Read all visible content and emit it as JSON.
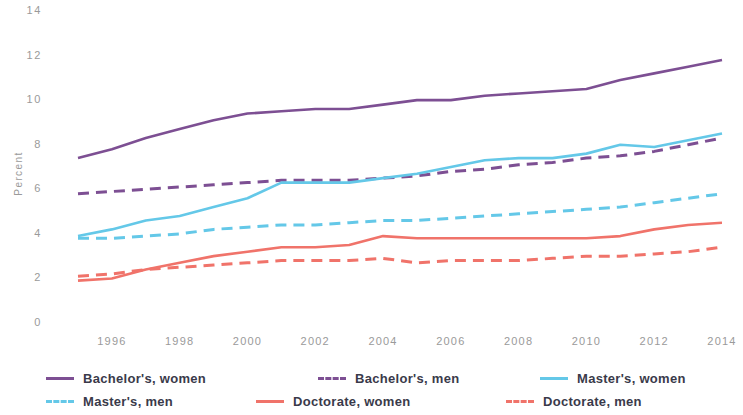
{
  "chart_data": {
    "type": "line",
    "title": "",
    "subtitle": "",
    "xlabel": "",
    "ylabel": "Percent",
    "grid": false,
    "legend_position": "bottom",
    "xlim": [
      1995,
      2014
    ],
    "ylim": [
      0,
      14
    ],
    "ytick_labels": [
      "14",
      "12",
      "10",
      "8",
      "6",
      "4",
      "2",
      "0"
    ],
    "ytick_values": [
      14,
      12,
      10,
      8,
      6,
      4,
      2,
      0
    ],
    "xtick_labels": [
      "1996",
      "1998",
      "2000",
      "2002",
      "2004",
      "2006",
      "2008",
      "2010",
      "2012",
      "2014"
    ],
    "xtick_values": [
      1996,
      1998,
      2000,
      2002,
      2004,
      2006,
      2008,
      2010,
      2012,
      2014
    ],
    "x": [
      1995,
      1996,
      1997,
      1998,
      1999,
      2000,
      2001,
      2002,
      2003,
      2004,
      2005,
      2006,
      2007,
      2008,
      2009,
      2010,
      2011,
      2012,
      2013,
      2014
    ],
    "series": [
      {
        "name": "Bachelor's, women",
        "color": "#7d4f93",
        "style": "solid",
        "values": [
          7.4,
          7.8,
          8.3,
          8.7,
          9.1,
          9.4,
          9.5,
          9.6,
          9.6,
          9.8,
          10.0,
          10.0,
          10.2,
          10.3,
          10.4,
          10.5,
          10.9,
          11.2,
          11.5,
          11.8
        ]
      },
      {
        "name": "Bachelor's, men",
        "color": "#7d4f93",
        "style": "dashed",
        "values": [
          5.8,
          5.9,
          6.0,
          6.1,
          6.2,
          6.3,
          6.4,
          6.4,
          6.4,
          6.5,
          6.6,
          6.8,
          6.9,
          7.1,
          7.2,
          7.4,
          7.5,
          7.7,
          8.0,
          8.3
        ]
      },
      {
        "name": "Master's, women",
        "color": "#64c8e8",
        "style": "solid",
        "values": [
          3.9,
          4.2,
          4.6,
          4.8,
          5.2,
          5.6,
          6.3,
          6.3,
          6.3,
          6.5,
          6.7,
          7.0,
          7.3,
          7.4,
          7.4,
          7.6,
          8.0,
          7.9,
          8.2,
          8.5
        ]
      },
      {
        "name": "Master's, men",
        "color": "#64c8e8",
        "style": "dashed",
        "values": [
          3.8,
          3.8,
          3.9,
          4.0,
          4.2,
          4.3,
          4.4,
          4.4,
          4.5,
          4.6,
          4.6,
          4.7,
          4.8,
          4.9,
          5.0,
          5.1,
          5.2,
          5.4,
          5.6,
          5.8
        ]
      },
      {
        "name": "Doctorate, women",
        "color": "#f0736a",
        "style": "solid",
        "values": [
          1.9,
          2.0,
          2.4,
          2.7,
          3.0,
          3.2,
          3.4,
          3.4,
          3.5,
          3.9,
          3.8,
          3.8,
          3.8,
          3.8,
          3.8,
          3.8,
          3.9,
          4.2,
          4.4,
          4.5
        ]
      },
      {
        "name": "Doctorate, men",
        "color": "#f0736a",
        "style": "dashed",
        "values": [
          2.1,
          2.2,
          2.4,
          2.5,
          2.6,
          2.7,
          2.8,
          2.8,
          2.8,
          2.9,
          2.7,
          2.8,
          2.8,
          2.8,
          2.9,
          3.0,
          3.0,
          3.1,
          3.2,
          3.4
        ]
      }
    ]
  },
  "legend": {
    "items": [
      {
        "label": "Bachelor's, women",
        "color": "#7d4f93",
        "style": "solid"
      },
      {
        "label": "Bachelor's, men",
        "color": "#7d4f93",
        "style": "dashed"
      },
      {
        "label": "Master's, women",
        "color": "#64c8e8",
        "style": "solid"
      },
      {
        "label": "Master's, men",
        "color": "#64c8e8",
        "style": "dashed"
      },
      {
        "label": "Doctorate, women",
        "color": "#f0736a",
        "style": "solid"
      },
      {
        "label": "Doctorate, men",
        "color": "#f0736a",
        "style": "dashed"
      }
    ]
  }
}
